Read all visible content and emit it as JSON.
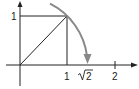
{
  "diagram": {
    "y_label_1": "1",
    "x_labels": {
      "one": "1",
      "sqrt2_radicand": "2",
      "two": "2"
    },
    "colors": {
      "lines": "#222222",
      "arc": "#888888",
      "background": "#ffffff"
    }
  }
}
